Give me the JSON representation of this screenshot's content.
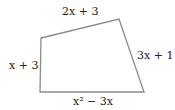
{
  "diagram": {
    "shape": "quadrilateral",
    "stroke_color": "#8a8a8a",
    "vertices": [
      [
        41,
        38
      ],
      [
        119,
        19
      ],
      [
        144,
        92
      ],
      [
        40,
        92
      ]
    ],
    "sides": {
      "top": "2x + 3",
      "right": "3x + 1",
      "bottom": "x² − 3x",
      "left": "x + 3"
    }
  }
}
